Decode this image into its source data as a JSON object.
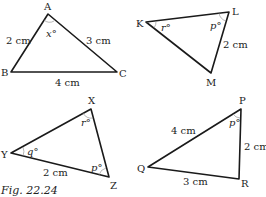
{
  "figure": {
    "caption": "Fig. 22.24",
    "triangles": [
      {
        "id": "ABC",
        "vertices": {
          "A": "A",
          "B": "B",
          "C": "C"
        },
        "sides": {
          "AB": "2 cm",
          "AC": "3 cm",
          "BC": "4 cm"
        },
        "angles": {
          "A": "x°"
        }
      },
      {
        "id": "KLM",
        "vertices": {
          "K": "K",
          "L": "L",
          "M": "M"
        },
        "sides": {
          "LM": "2 cm"
        },
        "angles": {
          "K": "r°",
          "L": "p°"
        }
      },
      {
        "id": "XYZ",
        "vertices": {
          "X": "X",
          "Y": "Y",
          "Z": "Z"
        },
        "sides": {
          "YZ": "2 cm"
        },
        "angles": {
          "X": "r°",
          "Y": "q°",
          "Z": "p°"
        }
      },
      {
        "id": "PQR",
        "vertices": {
          "P": "P",
          "Q": "Q",
          "R": "R"
        },
        "sides": {
          "PQ": "4 cm",
          "PR": "2 cm",
          "QR": "3 cm"
        },
        "angles": {
          "P": "p°"
        }
      }
    ]
  }
}
